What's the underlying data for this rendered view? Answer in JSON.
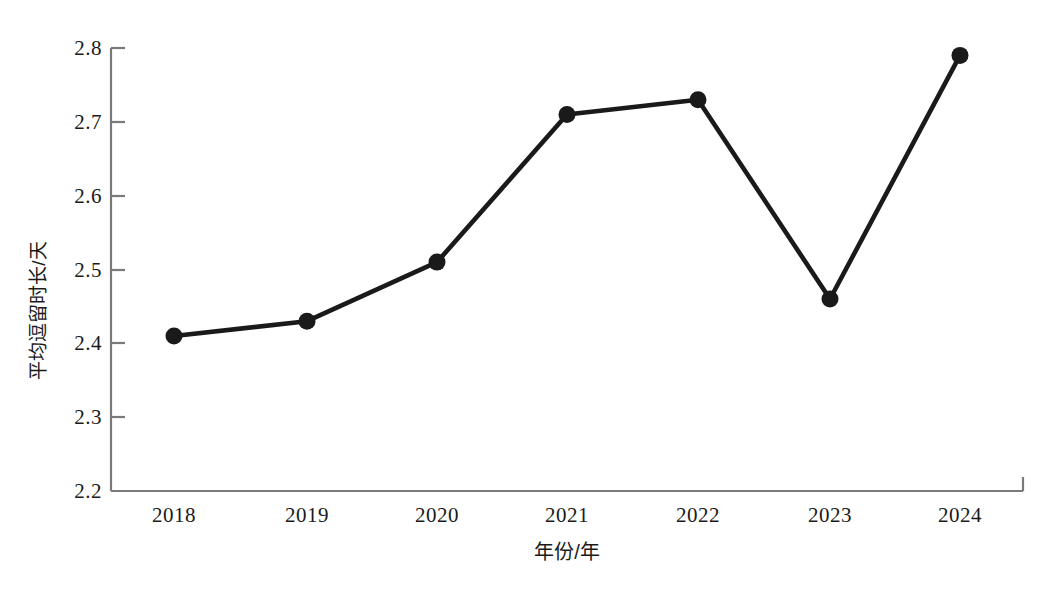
{
  "chart_data": {
    "type": "line",
    "title": "",
    "xlabel": "年份/年",
    "ylabel": "平均逗留时长/天",
    "categories": [
      "2018",
      "2019",
      "2020",
      "2021",
      "2022",
      "2023",
      "2024"
    ],
    "values": [
      2.41,
      2.43,
      2.51,
      2.71,
      2.73,
      2.46,
      2.79
    ],
    "series": [
      {
        "name": "平均逗留时长",
        "values": [
          2.41,
          2.43,
          2.51,
          2.71,
          2.73,
          2.46,
          2.79
        ]
      }
    ],
    "ylim": [
      2.2,
      2.8
    ],
    "yticks": [
      "2.2",
      "2.3",
      "2.4",
      "2.5",
      "2.6",
      "2.7",
      "2.8"
    ],
    "ytick_values": [
      2.2,
      2.3,
      2.4,
      2.5,
      2.6,
      2.7,
      2.8
    ],
    "xticks": [
      "2018",
      "2019",
      "2020",
      "2021",
      "2022",
      "2023",
      "2024"
    ],
    "grid": false,
    "legend": false,
    "legend_position": "none",
    "line_color": "#1a1a1a",
    "marker_color": "#1a1a1a",
    "marker": "circle",
    "axis_color": "#6b6b6b",
    "background_color": "#ffffff",
    "annotations": []
  },
  "axes": {
    "y_title": "平均逗留时长/天",
    "x_title": "年份/年"
  }
}
